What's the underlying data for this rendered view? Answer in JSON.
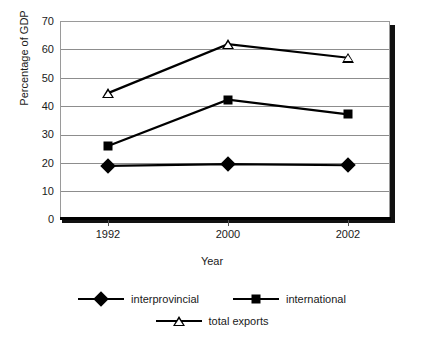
{
  "chart_data": {
    "type": "line",
    "title": "",
    "xlabel": "Year",
    "ylabel": "Percentage of GDP",
    "categories": [
      "1992",
      "2000",
      "2002"
    ],
    "x": [
      1992,
      2000,
      2002
    ],
    "ylim": [
      0,
      70
    ],
    "ytick_step": 10,
    "yticks": [
      70,
      60,
      50,
      40,
      30,
      20,
      10,
      0
    ],
    "grid": "horizontal",
    "legend_position": "bottom",
    "series": [
      {
        "name": "interprovincial",
        "marker": "filled-diamond",
        "color": "#000000",
        "values": [
          18.8,
          19.4,
          19.0
        ]
      },
      {
        "name": "international",
        "marker": "filled-square",
        "color": "#000000",
        "values": [
          25.8,
          42.2,
          37.0
        ]
      },
      {
        "name": "total exports",
        "marker": "open-triangle",
        "color": "#000000",
        "values": [
          44.5,
          61.8,
          57.0
        ]
      }
    ]
  },
  "axes": {
    "y_title": "Percentage of GDP",
    "x_title": "Year",
    "y_tick_labels": [
      "70",
      "60",
      "50",
      "40",
      "30",
      "20",
      "10",
      "0"
    ],
    "x_tick_labels": [
      "1992",
      "2000",
      "2002"
    ]
  },
  "legend": {
    "items": [
      {
        "label": "interprovincial",
        "marker": "filled-diamond"
      },
      {
        "label": "international",
        "marker": "filled-square"
      },
      {
        "label": "total exports",
        "marker": "open-triangle"
      }
    ]
  },
  "colors": {
    "series": "#000000",
    "gridline": "#8d8d8d",
    "plot_border": "#9a9a9a",
    "axis_shadow": "#111111",
    "background": "#ffffff",
    "text": "#1a1a1a"
  }
}
